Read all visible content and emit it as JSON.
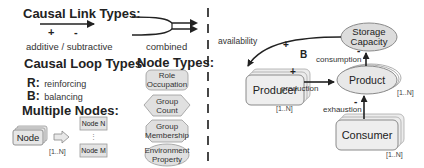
{
  "legend": {
    "causal_link_types": {
      "title": "Causal Link Types:",
      "plus": "+",
      "minus": "-",
      "caption": "additive / subtractive",
      "combined_caption": "combined"
    },
    "causal_loop_types": {
      "title": "Causal Loop Types",
      "items": [
        {
          "key": "R:",
          "label": "reinforcing"
        },
        {
          "key": "B:",
          "label": "balancing"
        }
      ]
    },
    "multiple_nodes": {
      "title": "Multiple Nodes:",
      "node_label": "Node",
      "multiplicity": "[1..N]",
      "expanded_first": "Node N",
      "expanded_dots": "⋮",
      "expanded_last": "Node M"
    },
    "node_types": {
      "title": "Node Types:",
      "items": [
        {
          "label_1": "Role",
          "label_2": "Occupation",
          "shape": "rounded-rect"
        },
        {
          "label_1": "Group",
          "label_2": "Count",
          "shape": "hexagon"
        },
        {
          "label_1": "Group",
          "label_2": "Membership",
          "shape": "octagon"
        },
        {
          "label_1": "Environment",
          "label_2": "Property",
          "shape": "ellipse"
        }
      ]
    }
  },
  "example": {
    "nodes": {
      "producer": {
        "label": "Producer",
        "multiplicity": "[1..N]"
      },
      "product": {
        "label": "Product",
        "multiplicity": "[1..N]"
      },
      "consumer": {
        "label": "Consumer",
        "multiplicity": "[1..N]"
      },
      "storage": {
        "label_1": "Storage",
        "label_2": "Capacity"
      }
    },
    "links": {
      "availability": {
        "label": "availability",
        "sign": "+"
      },
      "production": {
        "label": "production",
        "sign": "+"
      },
      "consumption": {
        "label": "consumption",
        "sign": "-"
      },
      "exhaustion": {
        "label": "exhaustion",
        "sign": "-"
      }
    },
    "loop_marker": "B"
  },
  "colors": {
    "node_fill": "#e3e3e3",
    "node_stroke": "#8a8a8a",
    "arrow": "#222222",
    "divider": "#333333"
  }
}
